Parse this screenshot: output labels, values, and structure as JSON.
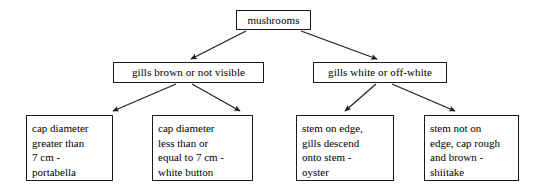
{
  "diagram": {
    "type": "decision-tree",
    "title": "mushrooms",
    "line_color": "#1a1a1a",
    "box_fill": "#ffffff",
    "text_color": "#000000",
    "root": {
      "id": "mushrooms",
      "label": "mushrooms"
    },
    "level2": [
      {
        "id": "gills-brown",
        "label": "gills brown or not visible"
      },
      {
        "id": "gills-white",
        "label": "gills white or off-white"
      }
    ],
    "leaves": [
      {
        "id": "portabella",
        "lines": [
          "cap diameter",
          "greater than",
          "7 cm -",
          "portabella"
        ]
      },
      {
        "id": "white-button",
        "lines": [
          "cap diameter",
          "less than or",
          "equal to 7 cm -",
          "white button"
        ]
      },
      {
        "id": "oyster",
        "lines": [
          "stem on edge,",
          "gills descend",
          "onto stem -",
          "oyster"
        ]
      },
      {
        "id": "shiitake",
        "lines": [
          "stem not on",
          "edge, cap rough",
          "and brown -",
          "shiitake"
        ]
      }
    ],
    "edges": [
      {
        "from": "mushrooms",
        "to": "gills-brown"
      },
      {
        "from": "mushrooms",
        "to": "gills-white"
      },
      {
        "from": "gills-brown",
        "to": "portabella"
      },
      {
        "from": "gills-brown",
        "to": "white-button"
      },
      {
        "from": "gills-white",
        "to": "oyster"
      },
      {
        "from": "gills-white",
        "to": "shiitake"
      }
    ]
  }
}
